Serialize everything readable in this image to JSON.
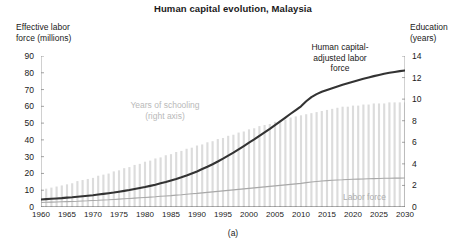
{
  "figure": {
    "title": "Human capital evolution, Malaysia",
    "panel_caption": "(a)"
  },
  "axes": {
    "left_title": "Effective labor\nforce (millions)",
    "right_title": "Education\n(years)",
    "left_ticks": [
      "90",
      "80",
      "70",
      "60",
      "50",
      "40",
      "30",
      "20",
      "10",
      "0"
    ],
    "right_ticks": [
      "14",
      "12",
      "10",
      "8",
      "6",
      "4",
      "2",
      "0"
    ],
    "x_ticks": [
      "1960",
      "1965",
      "1970",
      "1975",
      "1980",
      "1985",
      "1990",
      "1995",
      "2000",
      "2005",
      "2010",
      "2015",
      "2020",
      "2025",
      "2030"
    ]
  },
  "annotations": {
    "schooling": "Years of schooling\n(right axis)",
    "hc_adjusted_labor": "Human capital-\nadjusted labor\nforce",
    "labor_force": "Labor force"
  },
  "colors": {
    "hc_line": "#333333",
    "labor_line": "#a8a8a8",
    "bars": "#dcdcdc",
    "axis": "#8c8c8c",
    "annotation_gray": "#b9b9b9"
  },
  "chart_data": {
    "type": "line",
    "title": "Human capital evolution, Malaysia",
    "subtitle": "",
    "xlabel": "",
    "ylabel": "Effective labor force (millions)",
    "y2label": "Education (years)",
    "xlim": [
      1960,
      2030
    ],
    "ylim": [
      0,
      90
    ],
    "y2lim": [
      0,
      14
    ],
    "grid": false,
    "legend": "annotations-inline",
    "x": [
      1960,
      1961,
      1962,
      1963,
      1964,
      1965,
      1966,
      1967,
      1968,
      1969,
      1970,
      1971,
      1972,
      1973,
      1974,
      1975,
      1976,
      1977,
      1978,
      1979,
      1980,
      1981,
      1982,
      1983,
      1984,
      1985,
      1986,
      1987,
      1988,
      1989,
      1990,
      1991,
      1992,
      1993,
      1994,
      1995,
      1996,
      1997,
      1998,
      1999,
      2000,
      2001,
      2002,
      2003,
      2004,
      2005,
      2006,
      2007,
      2008,
      2009,
      2010,
      2011,
      2012,
      2013,
      2014,
      2015,
      2016,
      2017,
      2018,
      2019,
      2020,
      2021,
      2022,
      2023,
      2024,
      2025,
      2026,
      2027,
      2028,
      2029,
      2030
    ],
    "series": [
      {
        "name": "Human capital-adjusted labor force",
        "axis": "left",
        "unit": "millions",
        "color": "#333333",
        "values": [
          4.5,
          4.7,
          4.9,
          5.1,
          5.3,
          5.6,
          5.8,
          6.1,
          6.4,
          6.7,
          7.0,
          7.4,
          7.8,
          8.2,
          8.6,
          9.1,
          9.6,
          10.1,
          10.7,
          11.3,
          11.9,
          12.6,
          13.3,
          14.1,
          14.9,
          15.8,
          16.7,
          17.7,
          18.8,
          20.0,
          21.2,
          22.6,
          24.0,
          25.5,
          27.1,
          28.8,
          30.6,
          32.4,
          34.3,
          36.3,
          38.3,
          40.3,
          42.4,
          44.5,
          46.6,
          48.8,
          51.0,
          53.3,
          55.6,
          57.8,
          60.0,
          63.0,
          65.5,
          67.3,
          68.7,
          69.8,
          70.8,
          71.8,
          72.8,
          73.7,
          74.6,
          75.5,
          76.4,
          77.2,
          78.0,
          78.7,
          79.4,
          80.0,
          80.5,
          81.0,
          81.4
        ]
      },
      {
        "name": "Labor force",
        "axis": "left",
        "unit": "millions",
        "color": "#a8a8a8",
        "values": [
          2.7,
          2.8,
          2.9,
          3.0,
          3.1,
          3.2,
          3.3,
          3.4,
          3.6,
          3.7,
          3.9,
          4.0,
          4.2,
          4.3,
          4.5,
          4.7,
          4.9,
          5.1,
          5.3,
          5.5,
          5.7,
          5.9,
          6.1,
          6.4,
          6.6,
          6.8,
          7.1,
          7.3,
          7.6,
          7.9,
          8.1,
          8.4,
          8.7,
          9.0,
          9.3,
          9.6,
          9.9,
          10.2,
          10.5,
          10.8,
          11.1,
          11.4,
          11.7,
          12.0,
          12.3,
          12.6,
          12.9,
          13.2,
          13.5,
          13.8,
          14.1,
          14.5,
          14.9,
          15.2,
          15.5,
          15.7,
          15.9,
          16.1,
          16.2,
          16.4,
          16.5,
          16.6,
          16.7,
          16.8,
          16.9,
          17.0,
          17.1,
          17.1,
          17.2,
          17.2,
          17.3
        ]
      },
      {
        "name": "Years of schooling",
        "axis": "right",
        "unit": "years",
        "type": "bar",
        "color": "#dcdcdc",
        "values": [
          1.6,
          1.7,
          1.8,
          1.9,
          2.0,
          2.1,
          2.2,
          2.4,
          2.5,
          2.6,
          2.7,
          2.9,
          3.0,
          3.1,
          3.3,
          3.4,
          3.6,
          3.7,
          3.9,
          4.0,
          4.2,
          4.3,
          4.5,
          4.6,
          4.8,
          4.9,
          5.1,
          5.2,
          5.4,
          5.5,
          5.7,
          5.8,
          6.0,
          6.1,
          6.3,
          6.4,
          6.6,
          6.7,
          6.9,
          7.0,
          7.2,
          7.3,
          7.5,
          7.6,
          7.7,
          7.9,
          8.0,
          8.1,
          8.3,
          8.4,
          8.5,
          8.6,
          8.7,
          8.8,
          8.9,
          9.0,
          9.1,
          9.2,
          9.3,
          9.3,
          9.4,
          9.4,
          9.5,
          9.5,
          9.6,
          9.6,
          9.6,
          9.7,
          9.7,
          9.7,
          9.7
        ]
      }
    ]
  }
}
